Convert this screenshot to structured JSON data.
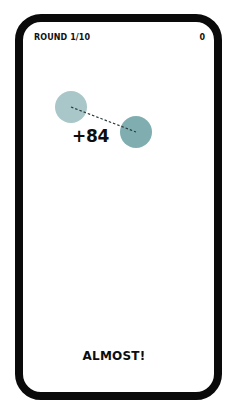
{
  "hud": {
    "round_label": "ROUND 1/10",
    "score": "0"
  },
  "game": {
    "points_awarded": "+84",
    "feedback": "ALMOST!",
    "colors": {
      "target_circle": "#a9c7c8",
      "guess_circle": "#80aeb0",
      "dashed_line": "#2a3a3c",
      "frame": "#0a0a0a"
    },
    "target_circle": {
      "cx": 71,
      "cy": 107,
      "r": 16
    },
    "guess_circle": {
      "cx": 136,
      "cy": 132,
      "r": 16
    }
  }
}
